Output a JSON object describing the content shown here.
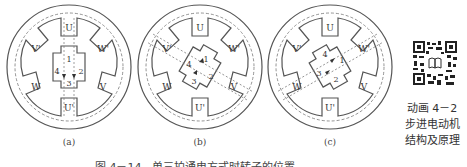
{
  "figure": {
    "panels": [
      {
        "id": "a",
        "label": "(a)",
        "rotor_angle": 0,
        "stator_poles": [
          "U",
          "W'",
          "V",
          "U'",
          "W",
          "V'"
        ],
        "rotor_teeth": [
          "1",
          "2",
          "3",
          "4"
        ]
      },
      {
        "id": "b",
        "label": "(b)",
        "rotor_angle": 30,
        "stator_poles": [
          "U",
          "W'",
          "V",
          "U'",
          "W",
          "V'"
        ],
        "rotor_teeth": [
          "1",
          "2",
          "3",
          "4"
        ]
      },
      {
        "id": "c",
        "label": "(c)",
        "rotor_angle": 60,
        "stator_poles": [
          "U",
          "W'",
          "V",
          "U'",
          "W",
          "V'"
        ],
        "rotor_teeth": [
          "1",
          "2",
          "3",
          "4"
        ]
      }
    ],
    "caption": "图 4－14　单三拍通电方式时转子的位置"
  },
  "qr": {
    "icon": "qr-code-icon",
    "center_icon": "book-icon",
    "caption_line1": "动画 4－2",
    "caption_line2": "步进电动机",
    "caption_line3": "结构及原理"
  },
  "colors": {
    "stroke": "#555555",
    "dashed": "#777777",
    "text": "#333333"
  }
}
